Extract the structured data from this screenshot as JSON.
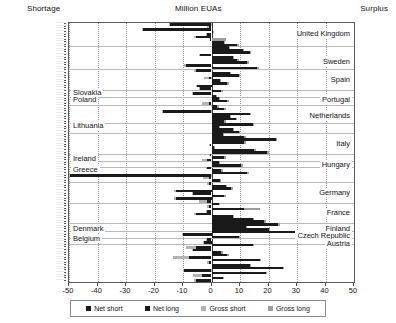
{
  "header": {
    "left_label": "Shortage",
    "title": "Million EUAs",
    "right_label": "Surplus"
  },
  "legend": {
    "items": [
      {
        "label": "Net short",
        "key": "net-short",
        "color": "#1a1a1a"
      },
      {
        "label": "Net long",
        "key": "net-long",
        "color": "#1a1a1a"
      },
      {
        "label": "Gross short",
        "key": "gross-short",
        "color": "#b3b3b3"
      },
      {
        "label": "Gross long",
        "key": "gross-long",
        "color": "#9d9d9d"
      }
    ]
  },
  "chart_data": {
    "type": "bar",
    "orientation": "horizontal",
    "title": "Million EUAs",
    "xlabel": "Million EUAs",
    "ylabel": "",
    "xlim": [
      -50,
      50
    ],
    "xticks": [
      -50,
      -40,
      -30,
      -20,
      -10,
      0,
      10,
      20,
      30,
      40,
      50
    ],
    "xticklabels": [
      "-50",
      "-40",
      "-30",
      "-20",
      "-10",
      "0",
      "10",
      "20",
      "30",
      "40",
      "50"
    ],
    "grid": "vertical-dotted-plus-horizontal-country-separators",
    "legend_position": "bottom",
    "series_names": [
      "Net short",
      "Net long",
      "Gross short",
      "Gross long"
    ],
    "annotations": {
      "left_side_countries": [
        "Slovakia",
        "Poland",
        "Lithuania",
        "Ireland",
        "Greece",
        "Denmark",
        "Belgium"
      ],
      "right_side_countries": [
        "United Kingdom",
        "Sweden",
        "Spain",
        "Portugal",
        "Netherlands",
        "Italy",
        "Hungary",
        "Germany",
        "France",
        "Finland",
        "Czech Republic",
        "Austria"
      ]
    },
    "country_markers": [
      {
        "label": "United Kingdom",
        "side": "right",
        "row": 4
      },
      {
        "label": "Sweden",
        "side": "right",
        "row": 15
      },
      {
        "label": "Spain",
        "side": "right",
        "row": 22
      },
      {
        "label": "Slovakia",
        "side": "left",
        "row": 27
      },
      {
        "label": "Poland",
        "side": "left",
        "row": 30
      },
      {
        "label": "Portugal",
        "side": "right",
        "row": 30
      },
      {
        "label": "Netherlands",
        "side": "right",
        "row": 36
      },
      {
        "label": "Lithuania",
        "side": "left",
        "row": 40
      },
      {
        "label": "Italy",
        "side": "right",
        "row": 47
      },
      {
        "label": "Ireland",
        "side": "left",
        "row": 53
      },
      {
        "label": "Hungary",
        "side": "right",
        "row": 55
      },
      {
        "label": "Greece",
        "side": "left",
        "row": 57
      },
      {
        "label": "Germany",
        "side": "right",
        "row": 66
      },
      {
        "label": "France",
        "side": "right",
        "row": 74
      },
      {
        "label": "Denmark",
        "side": "left",
        "row": 80
      },
      {
        "label": "Finland",
        "side": "right",
        "row": 80
      },
      {
        "label": "Czech Republic",
        "side": "right",
        "row": 83
      },
      {
        "label": "Belgium",
        "side": "left",
        "row": 84
      },
      {
        "label": "Austria",
        "side": "right",
        "row": 86
      }
    ],
    "separator_rows": [
      9,
      18,
      26,
      29,
      32,
      39,
      43,
      51,
      54,
      56,
      62,
      70,
      78,
      81,
      84,
      86
    ],
    "rows": [
      {
        "net": -14.5,
        "gross": -15.0
      },
      {
        "net": -1.0,
        "gross": -1.5
      },
      {
        "net": -24.0,
        "gross": -24.5
      },
      {
        "net": 0.5,
        "gross": 0.8
      },
      {
        "net": -1.5,
        "gross": -2.0
      },
      {
        "net": -5.5,
        "gross": -6.0
      },
      {
        "net": -0.5,
        "gross": 5.0
      },
      {
        "net": 4.5,
        "gross": 4.8
      },
      {
        "net": 9.0,
        "gross": 9.5
      },
      {
        "net": 6.0,
        "gross": 6.5
      },
      {
        "net": 11.0,
        "gross": 11.5
      },
      {
        "net": 13.5,
        "gross": 14.0
      },
      {
        "net": -4.0,
        "gross": -4.5
      },
      {
        "net": 7.5,
        "gross": 8.0
      },
      {
        "net": 9.0,
        "gross": 9.5
      },
      {
        "net": 12.5,
        "gross": 13.0
      },
      {
        "net": -9.0,
        "gross": -9.5
      },
      {
        "net": 16.0,
        "gross": 16.5
      },
      {
        "net": -5.5,
        "gross": -6.0
      },
      {
        "net": 6.5,
        "gross": 7.0
      },
      {
        "net": 9.5,
        "gross": 10.0
      },
      {
        "net": -1.0,
        "gross": -2.5
      },
      {
        "net": 3.0,
        "gross": 3.5
      },
      {
        "net": 5.5,
        "gross": 6.0
      },
      {
        "net": -5.0,
        "gross": -5.5
      },
      {
        "net": -4.0,
        "gross": -4.5
      },
      {
        "net": 3.5,
        "gross": 4.0
      },
      {
        "net": -6.5,
        "gross": -7.0
      },
      {
        "net": 1.5,
        "gross": 2.0
      },
      {
        "net": 2.5,
        "gross": 3.0
      },
      {
        "net": 5.5,
        "gross": 6.0
      },
      {
        "net": -0.8,
        "gross": -3.5
      },
      {
        "net": 2.0,
        "gross": 2.5
      },
      {
        "net": 4.5,
        "gross": 5.0
      },
      {
        "net": -17.0,
        "gross": -17.5
      },
      {
        "net": 13.5,
        "gross": 14.0
      },
      {
        "net": 6.5,
        "gross": 7.0
      },
      {
        "net": 8.5,
        "gross": 9.0
      },
      {
        "net": 4.5,
        "gross": 5.0
      },
      {
        "net": 14.5,
        "gross": 15.0
      },
      {
        "net": 2.5,
        "gross": 3.0
      },
      {
        "net": 7.5,
        "gross": 8.0
      },
      {
        "net": 9.5,
        "gross": 10.0
      },
      {
        "net": 4.0,
        "gross": 4.5
      },
      {
        "net": 11.5,
        "gross": 12.0
      },
      {
        "net": 22.5,
        "gross": 23.0
      },
      {
        "net": 11.5,
        "gross": 12.0
      },
      {
        "net": -0.5,
        "gross": -1.0
      },
      {
        "net": 0.8,
        "gross": 1.2
      },
      {
        "net": 15.0,
        "gross": 15.5
      },
      {
        "net": 19.5,
        "gross": 20.0
      },
      {
        "net": -0.5,
        "gross": -1.0
      },
      {
        "net": 4.5,
        "gross": 5.0
      },
      {
        "net": -1.5,
        "gross": -3.5
      },
      {
        "net": 2.5,
        "gross": 3.0
      },
      {
        "net": 10.5,
        "gross": 11.0
      },
      {
        "net": -1.5,
        "gross": -2.0
      },
      {
        "net": 3.5,
        "gross": 4.0
      },
      {
        "net": 12.5,
        "gross": 13.0
      },
      {
        "net": -49.5,
        "gross": -50.0
      },
      {
        "net": -0.8,
        "gross": -3.0
      },
      {
        "net": 3.0,
        "gross": 3.5
      },
      {
        "net": -1.0,
        "gross": -1.5
      },
      {
        "net": 5.0,
        "gross": 5.5
      },
      {
        "net": 7.0,
        "gross": 7.5
      },
      {
        "net": -12.5,
        "gross": -13.0
      },
      {
        "net": -6.5,
        "gross": -7.0
      },
      {
        "net": 4.5,
        "gross": 5.0
      },
      {
        "net": -12.5,
        "gross": -13.0
      },
      {
        "net": -1.5,
        "gross": -4.5
      },
      {
        "net": 2.5,
        "gross": 3.0
      },
      {
        "net": -1.0,
        "gross": -1.5
      },
      {
        "net": 11.5,
        "gross": 17.0
      },
      {
        "net": -1.5,
        "gross": -2.0
      },
      {
        "net": -5.5,
        "gross": -6.0
      },
      {
        "net": 7.5,
        "gross": 8.0
      },
      {
        "net": 14.5,
        "gross": 15.0
      },
      {
        "net": 18.5,
        "gross": 19.0
      },
      {
        "net": 23.5,
        "gross": 24.0
      },
      {
        "net": 12.0,
        "gross": 12.5
      },
      {
        "net": 20.0,
        "gross": 20.5
      },
      {
        "net": 34.5,
        "gross": 35.0
      },
      {
        "net": -10.0,
        "gross": -10.5
      },
      {
        "net": 9.5,
        "gross": 10.0
      },
      {
        "net": -1.5,
        "gross": -2.0
      },
      {
        "net": -2.5,
        "gross": -3.0
      },
      {
        "net": 14.5,
        "gross": 15.0
      },
      {
        "net": -5.5,
        "gross": -9.0
      },
      {
        "net": -6.5,
        "gross": -7.0
      },
      {
        "net": 3.5,
        "gross": 4.0
      },
      {
        "net": 5.5,
        "gross": 6.0
      },
      {
        "net": -8.0,
        "gross": -13.5
      },
      {
        "net": 17.0,
        "gross": 17.5
      },
      {
        "net": -1.0,
        "gross": -1.5
      },
      {
        "net": 13.5,
        "gross": 14.0
      },
      {
        "net": 25.0,
        "gross": 25.5
      },
      {
        "net": -9.5,
        "gross": -10.0
      },
      {
        "net": 19.0,
        "gross": 19.5
      },
      {
        "net": -3.5,
        "gross": -6.5
      },
      {
        "net": 4.0,
        "gross": 4.5
      },
      {
        "net": -5.5,
        "gross": -6.0
      }
    ]
  }
}
